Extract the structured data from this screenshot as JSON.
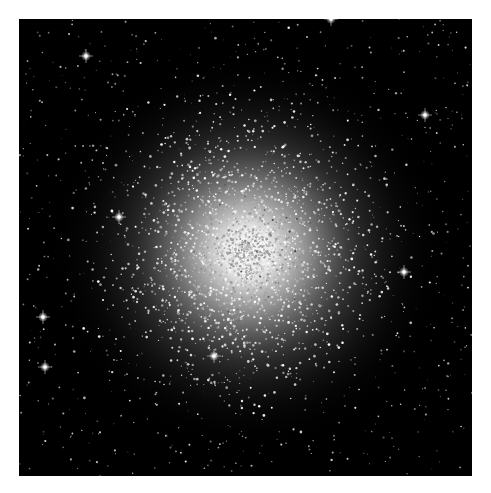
{
  "image": {
    "subject": "globular star cluster",
    "alt": "Dense globular star cluster with bright white core against black sky",
    "background_color": "#000000",
    "page_background": "#ffffff",
    "core_color": "#ffffff",
    "core_center": [
      229,
      233
    ],
    "bright_stars": [
      [
        100,
        198
      ],
      [
        406,
        96
      ],
      [
        26,
        348
      ],
      [
        24,
        298
      ],
      [
        195,
        337
      ],
      [
        312,
        0
      ],
      [
        67,
        37
      ],
      [
        385,
        253
      ]
    ]
  }
}
